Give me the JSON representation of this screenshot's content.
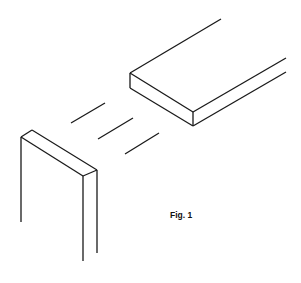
{
  "figure": {
    "label": "Fig. 1",
    "line_color": "#1a1a1a",
    "background_color": "#ffffff"
  },
  "parts": [
    {
      "name": "board",
      "description": "horizontal board, end face toward the post"
    },
    {
      "name": "alignment-dashes",
      "count": 3
    },
    {
      "name": "post",
      "description": "vertical post with top end visible"
    }
  ]
}
